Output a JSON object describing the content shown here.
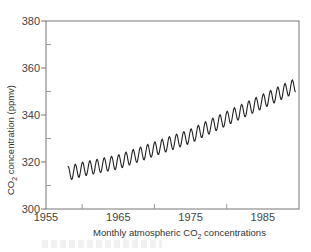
{
  "chart_data": {
    "type": "line",
    "title": "",
    "xlabel": "Monthly atmospheric CO2 concentrations",
    "ylabel": "CO2 concentration (ppmv)",
    "xlim": [
      1955,
      1990
    ],
    "ylim": [
      300,
      380
    ],
    "x_ticks": [
      1955,
      1965,
      1975,
      1985
    ],
    "x_minor_ticks": [
      1960,
      1970,
      1980
    ],
    "y_ticks": [
      300,
      320,
      340,
      360,
      380
    ],
    "y_minor_ticks": [
      310,
      330,
      350,
      370
    ],
    "grid": false,
    "legend": null,
    "series": [
      {
        "name": "Monthly CO2",
        "trend": {
          "x": [
            1958,
            1960,
            1965,
            1970,
            1975,
            1980,
            1985,
            1989.5
          ],
          "y": [
            315,
            316.9,
            320.0,
            325.5,
            331.0,
            338.5,
            345.8,
            352.5
          ]
        },
        "seasonal_amplitude_ppm": 3
      }
    ]
  },
  "labels": {
    "y_axis": "CO",
    "y_axis_sub": "2",
    "y_axis_rest": " concentration (ppmv)",
    "x_axis": "Monthly atmospheric CO",
    "x_axis_sub": "2",
    "x_axis_rest": " concentrations"
  }
}
